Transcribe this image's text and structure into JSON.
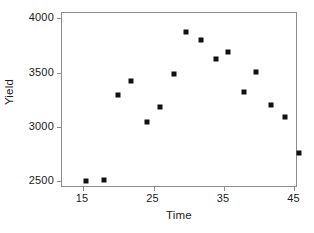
{
  "chart_data": {
    "type": "scatter",
    "title": "",
    "xlabel": "Time",
    "ylabel": "Yield",
    "xlim": [
      12.0,
      45.5
    ],
    "ylim": [
      2440,
      4050
    ],
    "xticks": [
      15,
      25,
      35,
      45
    ],
    "xtick_labels": [
      "15",
      "25",
      "35",
      "45"
    ],
    "yticks": [
      2500,
      3000,
      3500,
      4000
    ],
    "ytick_labels": [
      "2500",
      "3000",
      "3500",
      "4000"
    ],
    "grid": false,
    "legend": null,
    "marker": {
      "shape": "square",
      "color": "#111111",
      "size": 5
    },
    "frame_color": "#8c8c8c",
    "background": "#ffffff",
    "points": [
      {
        "x": 15.4,
        "y": 2505
      },
      {
        "x": 18.0,
        "y": 2510
      },
      {
        "x": 20.0,
        "y": 3300
      },
      {
        "x": 21.8,
        "y": 3420
      },
      {
        "x": 24.0,
        "y": 3050
      },
      {
        "x": 25.9,
        "y": 3185
      },
      {
        "x": 27.9,
        "y": 3490
      },
      {
        "x": 29.6,
        "y": 3875
      },
      {
        "x": 31.8,
        "y": 3805
      },
      {
        "x": 33.8,
        "y": 3630
      },
      {
        "x": 35.5,
        "y": 3695
      },
      {
        "x": 37.8,
        "y": 3325
      },
      {
        "x": 39.6,
        "y": 3505
      },
      {
        "x": 41.6,
        "y": 3205
      },
      {
        "x": 43.6,
        "y": 3090
      },
      {
        "x": 45.6,
        "y": 2765
      }
    ]
  }
}
